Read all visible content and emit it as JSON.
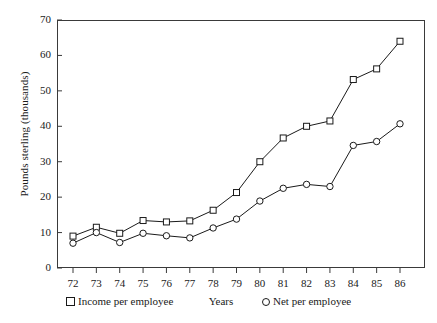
{
  "chart_data": {
    "type": "line",
    "title": "",
    "xlabel": "Years",
    "ylabel": "Pounds sterling (thousands)",
    "x": [
      "72",
      "73",
      "74",
      "75",
      "76",
      "77",
      "78",
      "79",
      "80",
      "81",
      "82",
      "83",
      "84",
      "85",
      "86"
    ],
    "xlim": [
      71.4,
      86.6
    ],
    "ylim": [
      0,
      70
    ],
    "yticks": [
      0,
      10,
      20,
      30,
      40,
      50,
      60,
      70
    ],
    "ytick_labels": [
      "0",
      "10",
      "20",
      "30",
      "40",
      "50",
      "60",
      "70"
    ],
    "xtick_labels": [
      "72",
      "73",
      "74",
      "75",
      "76",
      "77",
      "78",
      "79",
      "80",
      "81",
      "82",
      "83",
      "84",
      "85",
      "86"
    ],
    "grid": false,
    "legend_position": "below-axes",
    "series": [
      {
        "name": "Income per employee",
        "marker": "square",
        "color": "#1a1a1a",
        "values": [
          9.0,
          11.5,
          9.8,
          13.4,
          13.0,
          13.3,
          16.3,
          21.3,
          30.0,
          36.7,
          40.0,
          41.5,
          53.2,
          56.2,
          64.0
        ]
      },
      {
        "name": "Net per employee",
        "marker": "circle",
        "color": "#1a1a1a",
        "values": [
          7.0,
          10.0,
          7.2,
          9.8,
          9.1,
          8.5,
          11.3,
          13.8,
          18.9,
          22.5,
          23.6,
          23.0,
          34.6,
          35.7,
          40.7
        ]
      }
    ]
  },
  "legend": {
    "income_label": "Income per employee",
    "net_label": "Net per employee",
    "income_marker": "square-marker-icon",
    "net_marker": "circle-marker-icon"
  },
  "style": {
    "axis_color": "#3a3a3a",
    "line_color": "#1a1a1a",
    "background": "#ffffff"
  }
}
